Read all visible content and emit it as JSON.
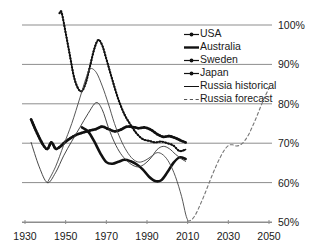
{
  "chart_data": {
    "type": "line",
    "title": "",
    "xlabel": "",
    "ylabel": "",
    "xlim": [
      1930,
      2050
    ],
    "ylim": [
      50,
      100
    ],
    "grid": true,
    "grid_axis": "y",
    "legend_position": "top-right",
    "x_ticks": [
      "1930",
      "1950",
      "1970",
      "1990",
      "2010",
      "2030",
      "2050"
    ],
    "x_tick_values": [
      1930,
      1950,
      1970,
      1990,
      2010,
      2030,
      2050
    ],
    "y_ticks": [
      "50%",
      "60%",
      "70%",
      "80%",
      "90%",
      "100%"
    ],
    "y_tick_values": [
      50,
      60,
      70,
      80,
      90,
      100
    ],
    "series": [
      {
        "name": "USA",
        "style": "thick-dotted-marker",
        "color": "#111111",
        "x": [
          1933,
          1936,
          1939,
          1941,
          1943,
          1945,
          1947,
          1950,
          1953,
          1956,
          1959,
          1962,
          1965,
          1968,
          1971,
          1974,
          1977,
          1980,
          1983,
          1986,
          1989,
          1992,
          1995,
          1998,
          2001,
          2004,
          2007,
          2009
        ],
        "values": [
          76.0,
          72.5,
          69.5,
          68.5,
          70.2,
          68.6,
          69.0,
          70.4,
          71.5,
          72.3,
          72.8,
          73.2,
          73.6,
          74.2,
          73.6,
          73.0,
          73.4,
          74.2,
          74.1,
          73.8,
          74.0,
          73.4,
          72.3,
          71.6,
          71.8,
          71.3,
          70.6,
          70.2
        ]
      },
      {
        "name": "Australia",
        "style": "thick-solid",
        "color": "#111111",
        "x": [
          1958,
          1961,
          1964,
          1967,
          1970,
          1973,
          1976,
          1979,
          1982,
          1985,
          1988,
          1991,
          1994,
          1997,
          2000,
          2003,
          2006,
          2009
        ],
        "values": [
          74.0,
          73.0,
          70.5,
          67.5,
          65.2,
          64.8,
          65.3,
          65.8,
          65.4,
          64.6,
          63.3,
          61.5,
          60.4,
          60.6,
          62.6,
          65.0,
          66.4,
          66.0
        ]
      },
      {
        "name": "Sweden",
        "style": "thin-solid",
        "color": "#333333",
        "x": [
          1933,
          1937,
          1941,
          1945,
          1949,
          1953,
          1957,
          1961,
          1965,
          1968,
          1971,
          1974,
          1977,
          1980,
          1983,
          1986,
          1989,
          1992,
          1995,
          1998,
          2001,
          2004,
          2007,
          2009
        ],
        "values": [
          70.2,
          64.0,
          60.0,
          62.5,
          66.8,
          70.5,
          74.0,
          77.5,
          80.3,
          78.5,
          74.0,
          70.2,
          67.4,
          65.6,
          64.4,
          64.0,
          64.8,
          66.3,
          68.4,
          69.2,
          68.6,
          67.2,
          66.0,
          65.4
        ]
      },
      {
        "name": "Japan",
        "style": "thin-dotted-marker",
        "color": "#111111",
        "x": [
          1947,
          1948,
          1950,
          1952,
          1954,
          1956,
          1958,
          1960,
          1962,
          1964,
          1966,
          1968,
          1970,
          1973,
          1976,
          1979,
          1982,
          1985,
          1988,
          1991,
          1994,
          1997,
          2000,
          2003,
          2006,
          2009
        ],
        "values": [
          103.0,
          103.2,
          98.0,
          92.5,
          87.0,
          84.0,
          83.2,
          85.5,
          89.6,
          93.8,
          96.2,
          94.8,
          91.4,
          86.0,
          81.0,
          77.2,
          74.6,
          72.4,
          71.0,
          70.6,
          70.2,
          70.4,
          70.0,
          69.4,
          68.0,
          68.4
        ]
      },
      {
        "name": "Russia historical",
        "style": "thin-solid",
        "color": "#444444",
        "x": [
          1941,
          1945,
          1949,
          1953,
          1957,
          1960,
          1962,
          1965,
          1968,
          1971,
          1974,
          1977,
          1980,
          1983,
          1986,
          1989,
          1992,
          1995,
          1998,
          2001,
          2004,
          2007,
          2009,
          2010
        ],
        "values": [
          60.0,
          64.0,
          69.5,
          75.0,
          81.5,
          86.5,
          88.9,
          88.0,
          84.5,
          80.0,
          75.0,
          71.0,
          68.0,
          66.0,
          65.2,
          65.6,
          66.6,
          67.6,
          67.0,
          65.0,
          61.5,
          56.5,
          52.0,
          50.5
        ]
      },
      {
        "name": "Russia forecast",
        "style": "dashed",
        "color": "#777777",
        "x": [
          2010,
          2012,
          2014,
          2016,
          2018,
          2020,
          2022,
          2024,
          2026,
          2028,
          2030,
          2032,
          2034,
          2036,
          2038,
          2040,
          2042,
          2044,
          2046,
          2048,
          2050
        ],
        "values": [
          50.2,
          50.6,
          52.0,
          54.2,
          56.6,
          59.2,
          61.8,
          64.2,
          66.4,
          68.2,
          69.4,
          69.6,
          69.3,
          69.6,
          70.6,
          72.2,
          74.4,
          76.8,
          79.4,
          81.8,
          84.0
        ]
      }
    ]
  },
  "legend": {
    "items": [
      {
        "label": "USA",
        "marker": "dotted-marker-line"
      },
      {
        "label": "Australia",
        "marker": "thick-line"
      },
      {
        "label": "Sweden",
        "marker": "dotted-marker-line"
      },
      {
        "label": "Japan",
        "marker": "dotted-marker-line"
      },
      {
        "label": "Russia historical",
        "marker": "thin-line"
      },
      {
        "label": "Russia forecast",
        "marker": "dashed-line"
      }
    ]
  }
}
